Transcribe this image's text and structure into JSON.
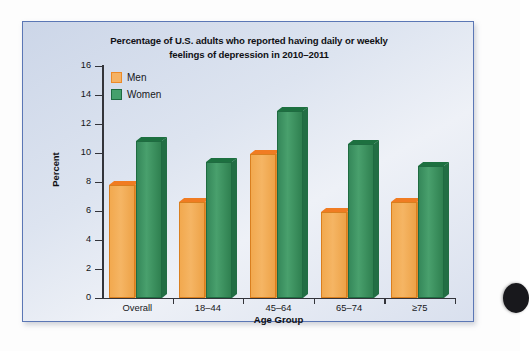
{
  "figure": {
    "title": "Percentage of U.S. adults who reported having daily or weekly feelings of depression in 2010–2011",
    "title_line1": "Percentage of U.S. adults who reported having daily or weekly",
    "title_line2": "feelings of depression in 2010–2011",
    "panel_background": "#dde4f0",
    "panel_border_color": "#5b77b5"
  },
  "chart_data": {
    "type": "bar",
    "title": "Percentage of U.S. adults who reported having daily or weekly feelings of depression in 2010–2011",
    "xlabel": "Age Group",
    "ylabel": "Percent",
    "categories": [
      "Overall",
      "18–44",
      "45–64",
      "65–74",
      "≥75"
    ],
    "series": [
      {
        "name": "Men",
        "color": "#f2a94f",
        "values": [
          7.8,
          6.6,
          9.9,
          5.9,
          6.6
        ]
      },
      {
        "name": "Women",
        "color": "#35885a",
        "values": [
          10.8,
          9.4,
          12.9,
          10.6,
          9.1
        ]
      }
    ],
    "ylim": [
      0,
      16
    ],
    "ytick_values": [
      0,
      2,
      4,
      6,
      8,
      10,
      12,
      14,
      16
    ],
    "ytick_labels": [
      "0",
      "2",
      "4",
      "6",
      "8",
      "10",
      "12",
      "14",
      "16"
    ],
    "grid": false,
    "legend_position": "top-left",
    "style": "3d-bars"
  },
  "legend": {
    "items": [
      {
        "label": "Men",
        "swatch": "men-color-swatch"
      },
      {
        "label": "Women",
        "swatch": "women-color-swatch"
      }
    ]
  }
}
